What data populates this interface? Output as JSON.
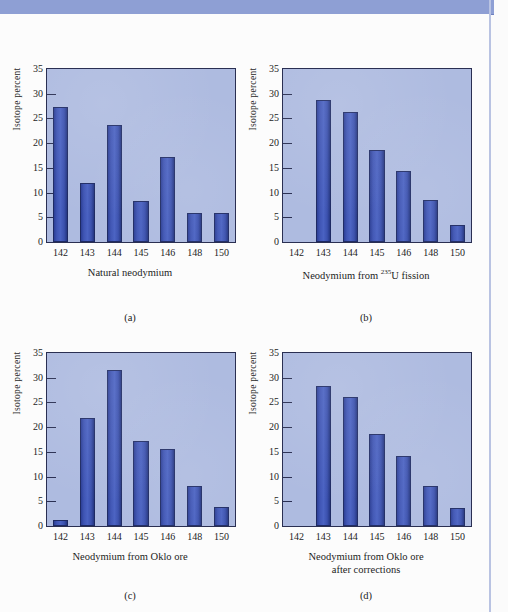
{
  "figure": {
    "y_axis_label": "Isotope percent",
    "y_ticks": [
      0,
      5,
      10,
      15,
      20,
      25,
      30,
      35
    ],
    "y_range": [
      0,
      35
    ],
    "categories": [
      "142",
      "143",
      "144",
      "145",
      "146",
      "148",
      "150"
    ]
  },
  "panels": [
    {
      "letter": "(a)",
      "caption": "Natural neodymium",
      "caption_line2": "",
      "caption_sup": "",
      "caption_pre": "",
      "caption_post": "",
      "values": [
        27.3,
        12.0,
        23.7,
        8.3,
        17.1,
        5.9,
        5.9
      ]
    },
    {
      "letter": "(b)",
      "caption": "",
      "caption_line2": "",
      "caption_pre": "Neodymium from ",
      "caption_sup": "235",
      "caption_post": "U fission",
      "values": [
        0,
        28.8,
        26.4,
        18.7,
        14.3,
        8.4,
        3.4
      ]
    },
    {
      "letter": "(c)",
      "caption": "Neodymium from Oklo ore",
      "caption_line2": "",
      "caption_sup": "",
      "caption_pre": "",
      "caption_post": "",
      "values": [
        1.3,
        21.8,
        31.5,
        17.2,
        15.5,
        8.1,
        3.8
      ]
    },
    {
      "letter": "(d)",
      "caption": "Neodymium from Oklo ore",
      "caption_line2": "after corrections",
      "caption_sup": "",
      "caption_pre": "",
      "caption_post": "",
      "values": [
        0,
        28.3,
        26.1,
        18.7,
        14.2,
        8.0,
        3.6
      ]
    }
  ],
  "chart_data": {
    "type": "bar",
    "title": "",
    "xlabel": "Mass number",
    "ylabel": "Isotope percent",
    "ylim": [
      0,
      35
    ],
    "grid": false,
    "legend": "none",
    "categories": [
      "142",
      "143",
      "144",
      "145",
      "146",
      "148",
      "150"
    ],
    "panels": [
      {
        "panel": "(a)",
        "subtitle": "Natural neodymium",
        "values": [
          27.3,
          12.0,
          23.7,
          8.3,
          17.1,
          5.9,
          5.9
        ]
      },
      {
        "panel": "(b)",
        "subtitle": "Neodymium from 235U fission",
        "values": [
          0,
          28.8,
          26.4,
          18.7,
          14.3,
          8.4,
          3.4
        ]
      },
      {
        "panel": "(c)",
        "subtitle": "Neodymium from Oklo ore",
        "values": [
          1.3,
          21.8,
          31.5,
          17.2,
          15.5,
          8.1,
          3.8
        ]
      },
      {
        "panel": "(d)",
        "subtitle": "Neodymium from Oklo ore after corrections",
        "values": [
          0,
          28.3,
          26.1,
          18.7,
          14.2,
          8.0,
          3.6
        ]
      }
    ]
  },
  "colors": {
    "bar": "#3b51ae",
    "bar_edge": "#1e2a63",
    "plot_background": "#aebbe0",
    "axis": "#2a2f52",
    "banner": "#8e9fd4",
    "page_background": "#fbfbfb"
  }
}
